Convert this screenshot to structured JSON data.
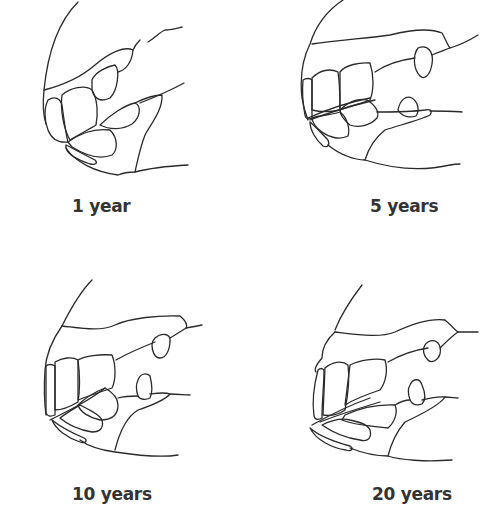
{
  "figure": {
    "panels": [
      {
        "label": "1 year",
        "icon": "horse-teeth-1-year-drawing"
      },
      {
        "label": "5 years",
        "icon": "horse-teeth-5-years-drawing"
      },
      {
        "label": "10 years",
        "icon": "horse-teeth-10-years-drawing"
      },
      {
        "label": "20 years",
        "icon": "horse-teeth-20-years-drawing"
      }
    ],
    "colors": {
      "line": "#2a2a2a",
      "text": "#333333",
      "background": "#ffffff"
    }
  }
}
